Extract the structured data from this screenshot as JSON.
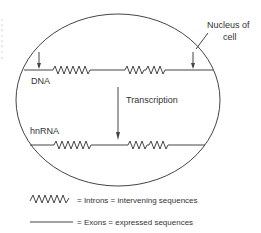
{
  "diagram": {
    "type": "biology-schematic",
    "labels": {
      "nucleus": "Nucleus of",
      "nucleus_line2": "cell",
      "dna": "DNA",
      "hnrna": "hnRNA",
      "process": "Transcription"
    },
    "legend": {
      "introns": "= Introns = intervening sequences",
      "exons": "= Exons = expressed sequences"
    },
    "colors": {
      "line": "#444444",
      "text": "#333333",
      "background": "#ffffff"
    }
  }
}
